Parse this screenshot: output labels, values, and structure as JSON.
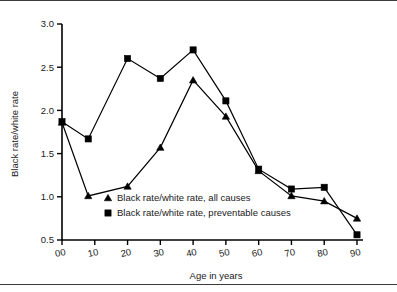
{
  "chart_data": {
    "type": "line",
    "title": "",
    "subtitle": "",
    "xlabel": "Age in years",
    "ylabel": "Black rate/white rate",
    "xlim": [
      0,
      90
    ],
    "ylim": [
      0.5,
      3.0
    ],
    "x_ticks": [
      "00",
      "10",
      "20",
      "30",
      "40",
      "50",
      "60",
      "70",
      "80",
      "90"
    ],
    "x_tick_values": [
      0,
      10,
      20,
      30,
      40,
      50,
      60,
      70,
      80,
      90
    ],
    "y_ticks": [
      "0.5",
      "1.0",
      "1.5",
      "2.0",
      "2.5",
      "3.0"
    ],
    "y_tick_values": [
      0.5,
      1.0,
      1.5,
      2.0,
      2.5,
      3.0
    ],
    "grid": false,
    "legend_position": "inside-lower-left",
    "x": [
      0,
      8,
      20,
      30,
      40,
      50,
      60,
      70,
      80,
      90
    ],
    "series": [
      {
        "name": "Black rate/white rate, all causes",
        "marker": "triangle",
        "color": "#000000",
        "values": [
          1.86,
          1.01,
          1.12,
          1.57,
          2.35,
          1.93,
          1.3,
          1.01,
          0.95,
          0.75
        ]
      },
      {
        "name": "Black rate/white rate, preventable causes",
        "marker": "square",
        "color": "#000000",
        "values": [
          1.87,
          1.67,
          2.6,
          2.37,
          2.7,
          2.11,
          1.32,
          1.09,
          1.11,
          0.56
        ]
      }
    ]
  },
  "legend": {
    "items": [
      {
        "marker": "triangle",
        "label": "Black rate/white rate, all causes"
      },
      {
        "marker": "square",
        "label": "Black rate/white rate, preventable causes"
      }
    ]
  },
  "axes": {
    "x_title": "Age in years",
    "y_title": "Black rate/white rate"
  }
}
